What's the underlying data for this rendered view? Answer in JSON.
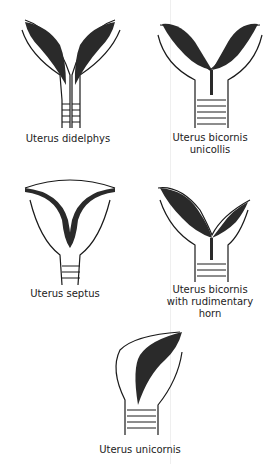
{
  "figure": {
    "panels": [
      {
        "id": "didelphys",
        "caption": "Uterus didelphys"
      },
      {
        "id": "bicornis-unicollis",
        "caption": "Uterus bicornis\nunicollis"
      },
      {
        "id": "septus",
        "caption": "Uterus septus"
      },
      {
        "id": "bicornis-rudimentary",
        "caption": "Uterus bicornis\nwith rudimentary\nhorn"
      },
      {
        "id": "unicornis",
        "caption": "Uterus unicornis"
      }
    ],
    "colors": {
      "line": "#1a1a1a",
      "fill": "#2a2a2a",
      "background": "#ffffff"
    }
  }
}
